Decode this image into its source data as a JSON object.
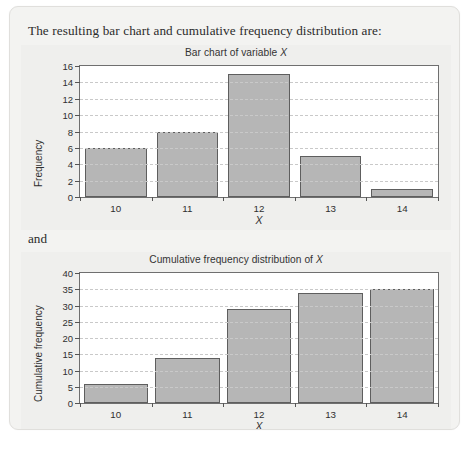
{
  "document": {
    "intro_text": "The resulting bar chart and cumulative frequency distribution are:",
    "connector_text": "and"
  },
  "style": {
    "bar_fill": "#b6b6b6",
    "bar_stroke": "#5e5e5e",
    "panel_bg": "#efefed",
    "plot_bg": "#ffffff",
    "grid_color": "#c9c9c9",
    "page_bg": "#f3f3f1"
  },
  "chart_data": [
    {
      "id": "bar-chart-of-variable-x",
      "type": "bar",
      "title": "Bar chart of variable X",
      "title_plain": "Bar chart of variable ",
      "title_italic": "X",
      "xlabel": "X",
      "ylabel": "Frequency",
      "categories": [
        "10",
        "11",
        "12",
        "13",
        "14"
      ],
      "values": [
        6,
        8,
        15,
        5,
        1
      ],
      "ylim": [
        0,
        16
      ],
      "yticks": [
        "16",
        "14",
        "12",
        "10",
        "8",
        "6",
        "4",
        "2",
        "0"
      ],
      "ytick_values": [
        16,
        14,
        12,
        10,
        8,
        6,
        4,
        2,
        0
      ],
      "grid": true,
      "legend": "none"
    },
    {
      "id": "cumulative-frequency-distribution-of-x",
      "type": "bar",
      "title": "Cumulative frequency distribution of X",
      "title_plain": "Cumulative frequency distribution of ",
      "title_italic": "X",
      "xlabel": "X",
      "ylabel": "Cumulative frequency",
      "categories": [
        "10",
        "11",
        "12",
        "13",
        "14"
      ],
      "values": [
        6,
        14,
        29,
        34,
        35
      ],
      "ylim": [
        0,
        40
      ],
      "yticks": [
        "40",
        "35",
        "30",
        "25",
        "20",
        "15",
        "10",
        "5",
        "0"
      ],
      "ytick_values": [
        40,
        35,
        30,
        25,
        20,
        15,
        10,
        5,
        0
      ],
      "grid": true,
      "legend": "none"
    }
  ]
}
